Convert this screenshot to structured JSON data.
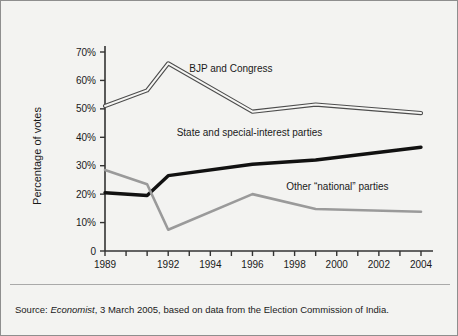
{
  "figure": {
    "background_color": "#f3f3f1",
    "border_color": "#8e8e8e"
  },
  "source": {
    "prefix": "Source: ",
    "publication": "Economist",
    "rest": ", 3 March 2005, based on data from the Election Commission of India."
  },
  "chart_data": {
    "type": "line",
    "title": "",
    "xlabel": "",
    "ylabel": "Percentage of votes",
    "xlim": [
      1989,
      2004
    ],
    "ylim": [
      0,
      70
    ],
    "grid": false,
    "legend_position": "inline-annotations",
    "x_tick_values": [
      1989,
      1990,
      1991,
      1992,
      1993,
      1994,
      1995,
      1996,
      1997,
      1998,
      1999,
      2000,
      2001,
      2002,
      2003,
      2004
    ],
    "x_tick_labels": [
      "1989",
      "",
      "",
      "1992",
      "",
      "1994",
      "",
      "1996",
      "",
      "1998",
      "",
      "2000",
      "",
      "2002",
      "",
      "2004"
    ],
    "y_tick_values": [
      0,
      10,
      20,
      30,
      40,
      50,
      60,
      70
    ],
    "y_tick_labels": [
      "0",
      "10%",
      "20%",
      "30%",
      "40%",
      "50%",
      "60%",
      "70%"
    ],
    "series": [
      {
        "name": "BJP and Congress",
        "style": "outlined-white",
        "color": "#ffffff",
        "stroke": "#4d4d4d",
        "x": [
          1989,
          1991,
          1992,
          1996,
          1999,
          2004
        ],
        "values": [
          51.0,
          56.5,
          66.0,
          49.0,
          51.5,
          48.5
        ],
        "label": "BJP and Congress",
        "label_x": 1993.0,
        "label_y": 63.0
      },
      {
        "name": "State and special-interest parties",
        "style": "solid-thick",
        "color": "#111111",
        "stroke": "#111111",
        "x": [
          1989,
          1991,
          1992,
          1996,
          1999,
          2004
        ],
        "values": [
          20.5,
          19.5,
          26.5,
          30.5,
          32.0,
          36.5
        ],
        "label": "State and special-interest parties",
        "label_x": 1992.4,
        "label_y": 40.5
      },
      {
        "name": "Other “national” parties",
        "style": "solid-gray",
        "color": "#9a9a9a",
        "stroke": "#9a9a9a",
        "x": [
          1989,
          1991,
          1992,
          1996,
          1999,
          2004
        ],
        "values": [
          28.5,
          23.5,
          7.5,
          20.0,
          14.8,
          13.8
        ],
        "label": "Other “national” parties",
        "label_x": 1997.6,
        "label_y": 21.5
      }
    ]
  }
}
